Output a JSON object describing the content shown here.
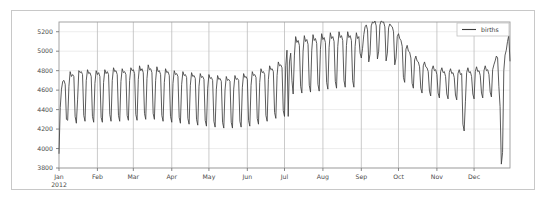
{
  "figure": {
    "background_color": "#ffffff",
    "border_color": "#c8c8c8",
    "line_color": "#3d3d3d",
    "grid_minor_color": "#e8e8e8",
    "grid_major_color": "#bdbdbd"
  },
  "legend": {
    "position": "top-right",
    "entries": [
      {
        "label": "births",
        "color": "#3d3d3d",
        "marker": "line"
      }
    ]
  },
  "axes": {
    "y_ticks": [
      "3800",
      "4000",
      "4200",
      "4400",
      "4600",
      "4800",
      "5000",
      "5200"
    ],
    "x_ticks": [
      "Jan",
      "Feb",
      "Mar",
      "Apr",
      "May",
      "Jun",
      "Jul",
      "Aug",
      "Sep",
      "Oct",
      "Nov",
      "Dec"
    ],
    "x_first_tick_sublabel": "2012"
  },
  "chart_data": {
    "type": "line",
    "title": "",
    "subtitle": "",
    "xlabel": "",
    "ylabel": "",
    "xlim": [
      "2012-01-01",
      "2012-12-31"
    ],
    "ylim": [
      3800,
      5300
    ],
    "grid": true,
    "legend_position": "top-right",
    "x_tick_labels": [
      "Jan",
      "Feb",
      "Mar",
      "Apr",
      "May",
      "Jun",
      "Jul",
      "Aug",
      "Sep",
      "Oct",
      "Nov",
      "Dec"
    ],
    "x_first_tick_sublabel": "2012",
    "y_tick_values": [
      3800,
      4000,
      4200,
      4400,
      4600,
      4800,
      5000,
      5200
    ],
    "series": [
      {
        "name": "births",
        "color": "#3d3d3d",
        "x_start": "2012-01-01",
        "x_step_days": 1,
        "units": "births per day",
        "values": [
          3950,
          4420,
          4610,
          4690,
          4700,
          4660,
          4300,
          4290,
          4640,
          4790,
          4740,
          4760,
          4740,
          4330,
          4260,
          4500,
          4800,
          4780,
          4790,
          4760,
          4340,
          4280,
          4700,
          4810,
          4770,
          4780,
          4740,
          4330,
          4270,
          4670,
          4800,
          4760,
          4780,
          4740,
          4320,
          4270,
          4680,
          4810,
          4770,
          4790,
          4760,
          4350,
          4280,
          4700,
          4830,
          4790,
          4800,
          4760,
          4340,
          4280,
          4690,
          4820,
          4780,
          4790,
          4760,
          4340,
          4290,
          4700,
          4830,
          4800,
          4810,
          4770,
          4350,
          4290,
          4710,
          4850,
          4800,
          4820,
          4780,
          4360,
          4300,
          4720,
          4860,
          4810,
          4820,
          4780,
          4360,
          4300,
          4700,
          4840,
          4790,
          4800,
          4760,
          4340,
          4280,
          4680,
          4820,
          4780,
          4790,
          4750,
          4330,
          4270,
          4670,
          4800,
          4760,
          4770,
          4740,
          4320,
          4260,
          4660,
          4790,
          4750,
          4760,
          4730,
          4310,
          4250,
          4650,
          4780,
          4740,
          4750,
          4720,
          4300,
          4240,
          4640,
          4770,
          4730,
          4740,
          4710,
          4290,
          4230,
          4620,
          4760,
          4720,
          4730,
          4700,
          4280,
          4220,
          4610,
          4750,
          4710,
          4720,
          4690,
          4270,
          4210,
          4600,
          4740,
          4700,
          4710,
          4690,
          4270,
          4210,
          4610,
          4750,
          4710,
          4720,
          4700,
          4280,
          4220,
          4630,
          4770,
          4730,
          4740,
          4710,
          4290,
          4230,
          4650,
          4790,
          4750,
          4760,
          4730,
          4310,
          4250,
          4680,
          4820,
          4780,
          4790,
          4760,
          4340,
          4280,
          4710,
          4850,
          4810,
          4820,
          4790,
          4370,
          4310,
          4750,
          4890,
          4850,
          4860,
          4830,
          4390,
          4330,
          4850,
          5010,
          4330,
          4890,
          4980,
          4700,
          4560,
          4960,
          5150,
          5090,
          5110,
          5060,
          4640,
          4570,
          5000,
          5160,
          5100,
          5120,
          5070,
          4650,
          4580,
          5010,
          5170,
          5110,
          5130,
          5080,
          4660,
          4590,
          5020,
          5180,
          5120,
          5140,
          5090,
          4680,
          4610,
          5040,
          5190,
          5130,
          5150,
          5100,
          4690,
          4620,
          5050,
          5200,
          5140,
          5160,
          5110,
          4700,
          4630,
          5060,
          5200,
          5140,
          5160,
          5110,
          4700,
          4630,
          5050,
          5190,
          5130,
          5150,
          4980,
          4930,
          5030,
          5170,
          5250,
          5270,
          5220,
          4890,
          4970,
          5260,
          5300,
          5290,
          5310,
          5260,
          4920,
          5000,
          5270,
          5310,
          5300,
          5300,
          5250,
          4900,
          4980,
          5240,
          5280,
          5260,
          5250,
          5200,
          4860,
          4930,
          5150,
          5180,
          5130,
          5110,
          5050,
          4730,
          4680,
          5020,
          5060,
          5000,
          4990,
          4930,
          4670,
          4620,
          4910,
          4950,
          4900,
          4890,
          4840,
          4620,
          4570,
          4850,
          4890,
          4840,
          4830,
          4790,
          4590,
          4540,
          4810,
          4850,
          4800,
          4810,
          4760,
          4570,
          4520,
          4790,
          4830,
          4780,
          4790,
          4740,
          4560,
          4510,
          4780,
          4820,
          4770,
          4780,
          4730,
          4550,
          4500,
          4770,
          4810,
          4760,
          4770,
          4250,
          4180,
          4480,
          4780,
          4830,
          4780,
          4790,
          4740,
          4560,
          4510,
          4790,
          4840,
          4790,
          4800,
          4750,
          4570,
          4520,
          4800,
          4850,
          4800,
          4810,
          4760,
          4580,
          4530,
          4810,
          4860,
          4900,
          4950,
          4930,
          4640,
          4430,
          3840,
          3960,
          4800,
          4960,
          5010,
          5100,
          5160,
          4900
        ]
      }
    ],
    "annotations": [
      {
        "label": "July 4 holiday dip",
        "approx_value": 4330
      },
      {
        "label": "Thanksgiving dip",
        "approx_value": 4180
      },
      {
        "label": "Christmas dip",
        "approx_value": 3840
      },
      {
        "label": "September peak",
        "approx_value": 5310
      },
      {
        "label": "New Year start",
        "approx_value": 3950
      }
    ]
  }
}
